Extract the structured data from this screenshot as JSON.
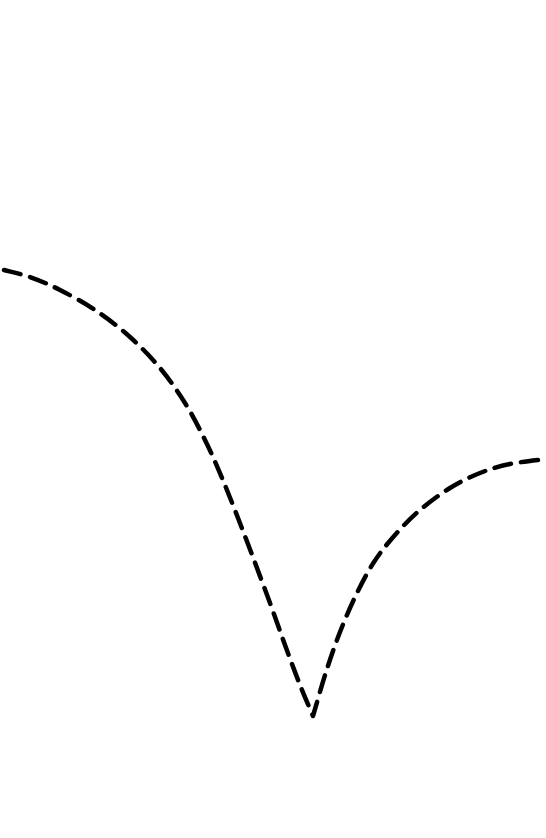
{
  "chart_data": {
    "type": "line",
    "title": "",
    "xlabel": "",
    "ylabel": "",
    "grid": false,
    "legend": null,
    "axes_visible": false,
    "series": [
      {
        "name": "curve",
        "line_style": "dashed",
        "color": "#000000",
        "points_px": [
          [
            4,
            270
          ],
          [
            30,
            277
          ],
          [
            60,
            290
          ],
          [
            95,
            310
          ],
          [
            130,
            337
          ],
          [
            160,
            368
          ],
          [
            185,
            403
          ],
          [
            205,
            440
          ],
          [
            222,
            478
          ],
          [
            238,
            518
          ],
          [
            254,
            560
          ],
          [
            270,
            603
          ],
          [
            285,
            645
          ],
          [
            300,
            685
          ],
          [
            313,
            716
          ],
          [
            326,
            672
          ],
          [
            340,
            632
          ],
          [
            356,
            595
          ],
          [
            374,
            562
          ],
          [
            395,
            535
          ],
          [
            420,
            510
          ],
          [
            450,
            488
          ],
          [
            480,
            473
          ],
          [
            510,
            464
          ],
          [
            546,
            459
          ]
        ]
      }
    ]
  },
  "colors": {
    "background": "#ffffff",
    "line": "#000000"
  }
}
